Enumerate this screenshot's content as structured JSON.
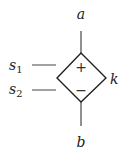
{
  "diagram": {
    "type": "circuit-element",
    "element": "dependent-source-diamond",
    "colors": {
      "stroke": "#222222",
      "text": "#222222"
    },
    "labels": {
      "top_terminal": "a",
      "bottom_terminal": "b",
      "gain": "k",
      "sense1": {
        "base": "s",
        "sub": "1"
      },
      "sense2": {
        "base": "s",
        "sub": "2"
      }
    },
    "polarity": {
      "plus": "+",
      "minus": "−"
    }
  }
}
